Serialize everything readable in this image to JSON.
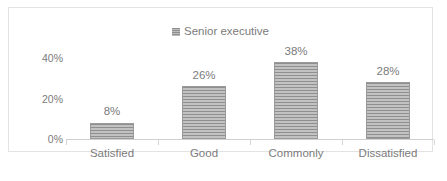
{
  "chart_data": {
    "type": "bar",
    "title": "",
    "subtitle": "",
    "xlabel": "",
    "ylabel": "",
    "categories": [
      "Satisfied",
      "Good",
      "Commonly",
      "Dissatisfied"
    ],
    "series": [
      {
        "name": "Senior executive",
        "values": [
          8,
          26,
          38,
          28
        ],
        "value_labels": [
          "8%",
          "26%",
          "38%",
          "28%"
        ],
        "color": "#a8a8a8",
        "fill_pattern": "horizontal-stripes"
      }
    ],
    "ylim": [
      0,
      45
    ],
    "y_ticks": [
      0,
      20,
      40
    ],
    "y_tick_labels": [
      "0%",
      "20%",
      "40%"
    ],
    "grid": false,
    "legend_position": "top-center",
    "legend_entries": [
      "Senior executive"
    ],
    "annotations": []
  },
  "legend": {
    "swatch_icon": "legend-swatch-icon",
    "label": "Senior executive"
  },
  "axes": {
    "y_tick_labels": [
      "40%",
      "20%",
      "0%"
    ],
    "x_tick_labels": [
      "Satisfied",
      "Good",
      "Commonly",
      "Dissatisfied"
    ]
  },
  "bars": [
    {
      "category": "Satisfied",
      "value": 8,
      "label": "8%"
    },
    {
      "category": "Good",
      "value": 26,
      "label": "26%"
    },
    {
      "category": "Commonly",
      "value": 38,
      "label": "38%"
    },
    {
      "category": "Dissatisfied",
      "value": 28,
      "label": "28%"
    }
  ],
  "colors": {
    "bar": "#a8a8a8",
    "bar_border": "#9a9a9a",
    "text": "#7b7b7b",
    "frame": "#e3e3e3",
    "axis": "#d0d0d0",
    "background": "#ffffff"
  }
}
